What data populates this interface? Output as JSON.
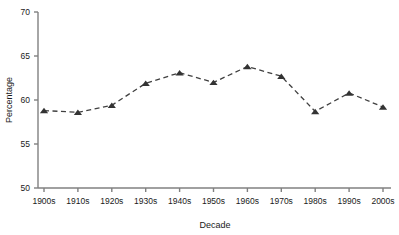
{
  "chart_data": {
    "type": "line",
    "title": "",
    "subtitle": "",
    "xlabel": "Decade",
    "ylabel": "Percentage",
    "categories": [
      "1900s",
      "1910s",
      "1920s",
      "1930s",
      "1940s",
      "1950s",
      "1960s",
      "1970s",
      "1980s",
      "1990s",
      "2000s"
    ],
    "values": [
      58.8,
      58.6,
      59.4,
      61.9,
      63.1,
      62.0,
      63.8,
      62.7,
      58.7,
      60.8,
      59.2
    ],
    "series": [
      {
        "name": "Percentage",
        "values": [
          58.8,
          58.6,
          59.4,
          61.9,
          63.1,
          62.0,
          63.8,
          62.7,
          58.7,
          60.8,
          59.2
        ]
      }
    ],
    "ylim": [
      50,
      70
    ],
    "yticks": [
      50,
      55,
      60,
      65,
      70
    ],
    "ytick_labels": [
      "50",
      "55",
      "60",
      "65",
      "70"
    ],
    "grid": false,
    "legend": false,
    "legend_position": "none",
    "line_style": "dashed",
    "marker": "triangle",
    "line_color": "#404040",
    "marker_color": "#333333",
    "axis_color": "#808080"
  },
  "axes": {
    "y_title": "Percentage",
    "x_title": "Decade"
  }
}
